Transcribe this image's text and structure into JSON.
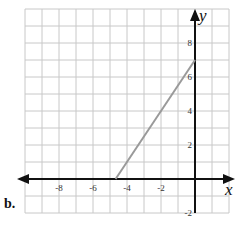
{
  "part_label": "b.",
  "chart_data": {
    "type": "line",
    "title": "",
    "xlabel": "x",
    "ylabel": "y",
    "xlim": [
      -10,
      2
    ],
    "ylim": [
      -2,
      10
    ],
    "x_ticks": [
      -8,
      -6,
      -4,
      -2
    ],
    "x_tick_labels": [
      "-8",
      "-6",
      "-4",
      "-2"
    ],
    "y_ticks": [
      2,
      4,
      6,
      8,
      -2
    ],
    "y_tick_labels": [
      "2",
      "4",
      "6",
      "8",
      "-2"
    ],
    "grid": true,
    "grid_step": 1,
    "series": [
      {
        "name": "segment",
        "x": [
          -4.67,
          0
        ],
        "y": [
          0,
          7
        ],
        "color": "#9a9a9a"
      }
    ],
    "axis_color": "#111111",
    "grid_color": "#c8c8c8"
  }
}
